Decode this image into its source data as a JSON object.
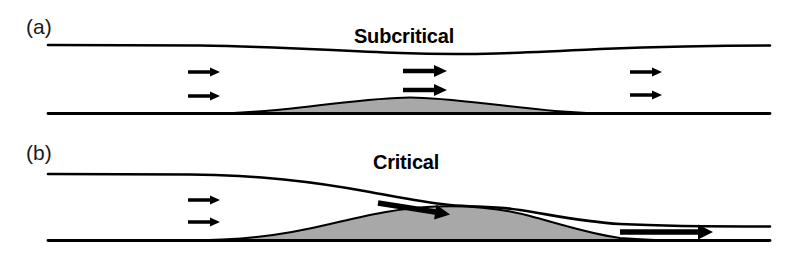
{
  "figure": {
    "width": 808,
    "height": 253,
    "background": "#ffffff",
    "line_color": "#000000",
    "bump_fill_color": "#a8a8a8"
  },
  "panels": [
    {
      "id": "panel-a",
      "label": "(a)",
      "regime": "Subcritical",
      "label_x": 26,
      "label_y": 34,
      "regime_x": 404,
      "regime_y": 43,
      "free_surface_path": "M 48 45 L 200 45.5 C 280 46.5 320 50 400 53 C 470 55.5 520 53 600 49 C 660 46.5 700 45.5 770 45.5",
      "bed_line_path": "M 48 113.5 L 770 113.5",
      "bump_path": "M 200 113.5 C 250 113.5 280 110 330 104 C 370 99.5 390 97.5 410 97.5 C 430 97.5 450 99.5 490 104 C 540 110 570 113.5 620 113.5 Z",
      "arrows": [
        {
          "name": "upstream-upper",
          "x": 188,
          "y": 72,
          "length": 22,
          "thickness": 3.4,
          "head_w": 9,
          "head_h": 10,
          "angle": 0
        },
        {
          "name": "upstream-lower",
          "x": 188,
          "y": 96,
          "length": 22,
          "thickness": 3.4,
          "head_w": 9,
          "head_h": 10,
          "angle": 0
        },
        {
          "name": "crest-upper",
          "x": 403,
          "y": 71,
          "length": 31,
          "thickness": 4.6,
          "head_w": 12,
          "head_h": 13,
          "angle": 0
        },
        {
          "name": "crest-lower",
          "x": 403,
          "y": 90,
          "length": 31,
          "thickness": 4.6,
          "head_w": 12,
          "head_h": 13,
          "angle": 0
        },
        {
          "name": "downstream-upper",
          "x": 630,
          "y": 72,
          "length": 22,
          "thickness": 3.4,
          "head_w": 9,
          "head_h": 10,
          "angle": 0
        },
        {
          "name": "downstream-lower",
          "x": 630,
          "y": 95,
          "length": 22,
          "thickness": 3.4,
          "head_w": 9,
          "head_h": 10,
          "angle": 0
        }
      ]
    },
    {
      "id": "panel-b",
      "label": "(b)",
      "regime": "Critical",
      "label_x": 26,
      "label_y": 160,
      "regime_x": 406,
      "regime_y": 169,
      "free_surface_path": "M 48 174 L 190 174.5 C 260 175.5 310 181 370 192 C 400 197.5 420 202 450 205 C 475 207.2 495 206 520 210 C 555 215.5 585 222 620 224 C 670 226.5 720 226.5 770 226.5",
      "bed_line_path": "M 48 240.5 L 770 240.5",
      "bump_path": "M 180 240.5 C 240 240.5 280 236 330 224 C 370 214.5 400 208 435 206.5 C 470 205 500 208 530 216 C 560 224 590 234 620 238 C 650 240.5 680 240.5 700 240.5 Z",
      "arrows": [
        {
          "name": "upstream-upper",
          "x": 188,
          "y": 200,
          "length": 22,
          "thickness": 3.4,
          "head_w": 9,
          "head_h": 10,
          "angle": 0
        },
        {
          "name": "upstream-lower",
          "x": 188,
          "y": 222,
          "length": 22,
          "thickness": 3.4,
          "head_w": 9,
          "head_h": 10,
          "angle": 0
        },
        {
          "name": "crest-transition",
          "x": 378,
          "y": 203,
          "length": 58,
          "thickness": 5.5,
          "head_w": 15,
          "head_h": 15,
          "angle": 9
        },
        {
          "name": "downstream-supercritical",
          "x": 620,
          "y": 232,
          "length": 78,
          "thickness": 5.5,
          "head_w": 15,
          "head_h": 15,
          "angle": 0
        }
      ]
    }
  ]
}
